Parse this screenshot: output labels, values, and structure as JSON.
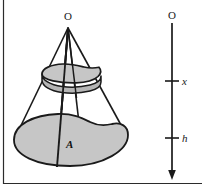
{
  "figure": {
    "labels": {
      "apex": "O",
      "base_region": "A",
      "axis_origin": "O",
      "axis_tick_x": "x",
      "axis_tick_h": "h"
    },
    "colors": {
      "shape_fill": "#c6c6c6",
      "outline": "#1a1a1a",
      "frame": "#2b2b2b",
      "background": "#ffffff",
      "label": "#1a1a1a"
    },
    "geometry": {
      "apex_point": "68,28",
      "cross_section_depth_label": "x",
      "total_depth_label": "h",
      "axis_top": "172,22",
      "axis_bottom": "172,178",
      "tick_x_y": 81,
      "tick_h_y": 138
    },
    "frame": {
      "left_border": true,
      "bottom_border": true,
      "top_border": false,
      "right_border": false
    }
  }
}
